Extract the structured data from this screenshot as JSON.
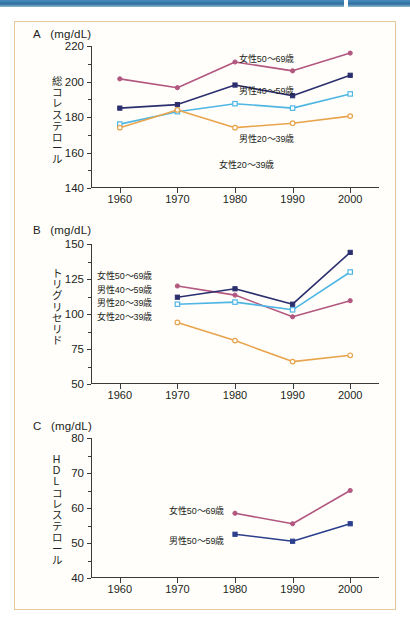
{
  "figure": {
    "frame_color": "#e8c79a",
    "top_bar_color": "#3b7da9"
  },
  "series_colors": {
    "female_50_69": "#b2577f",
    "male_40_59": "#2b2f6e",
    "male_20_39": "#4fb6e3",
    "female_20_39": "#e8a44c",
    "male_50_59": "#2b3f8c"
  },
  "series_labels": {
    "female_50_69": "女性50〜69歳",
    "male_40_59": "男性40〜59歳",
    "male_20_39": "男性20〜39歳",
    "female_20_39": "女性20〜39歳",
    "male_50_59": "男性50〜59歳"
  },
  "panels": {
    "A": {
      "letter": "A",
      "unit": "(mg/dL)",
      "caption_chars": [
        "総",
        "コ",
        "レ",
        "ス",
        "テ",
        "ロ",
        "ー",
        "ル"
      ],
      "caption_text": "総コレステロール",
      "y_ticks": [
        "140",
        "160",
        "180",
        "200",
        "220"
      ],
      "x_ticks": [
        "1960",
        "1970",
        "1980",
        "1990",
        "2000"
      ],
      "annotations": [
        {
          "text": "女性50〜69歳",
          "x": 148,
          "y": 6
        },
        {
          "text": "男性40〜59歳",
          "x": 148,
          "y": 38
        },
        {
          "text": "男性20〜39歳",
          "x": 148,
          "y": 86
        },
        {
          "text": "女性20〜39歳",
          "x": 128,
          "y": 112
        }
      ]
    },
    "B": {
      "letter": "B",
      "unit": "(mg/dL)",
      "caption_chars": [
        "ト",
        "リ",
        "グ",
        "リ",
        "セ",
        "リ",
        "ド"
      ],
      "caption_text": "トリグリセリド",
      "y_ticks": [
        "50",
        "75",
        "100",
        "125",
        "150"
      ],
      "x_ticks": [
        "1960",
        "1970",
        "1980",
        "1990",
        "2000"
      ],
      "legend": [
        "女性50〜69歳",
        "男性40〜59歳",
        "男性20〜39歳",
        "女性20〜39歳"
      ]
    },
    "C": {
      "letter": "C",
      "unit": "(mg/dL)",
      "caption_chars": [
        "H",
        "D",
        "L",
        "コ",
        "レ",
        "ス",
        "テ",
        "ロ",
        "ー",
        "ル"
      ],
      "caption_text": "HDLコレステロール",
      "y_ticks": [
        "40",
        "50",
        "60",
        "70",
        "80"
      ],
      "x_ticks": [
        "1960",
        "1970",
        "1980",
        "1990",
        "2000"
      ],
      "annotations": [
        {
          "text": "女性50〜69歳",
          "x": 78,
          "y": 66
        },
        {
          "text": "男性50〜59歳",
          "x": 78,
          "y": 96
        }
      ]
    }
  },
  "chart_data": [
    {
      "type": "line",
      "panel": "A",
      "title": "総コレステロール",
      "xlabel": "",
      "ylabel": "総コレステロール (mg/dL)",
      "unit": "mg/dL",
      "x": [
        1960,
        1970,
        1980,
        1990,
        2000
      ],
      "ylim": [
        140,
        220
      ],
      "yticks": [
        140,
        160,
        180,
        200,
        220
      ],
      "grid": false,
      "legend": "inline-annotations",
      "series": [
        {
          "name": "女性50〜69歳",
          "color": "#b2577f",
          "marker": "filled-circle",
          "x": [
            1960,
            1970,
            1980,
            1990,
            2000
          ],
          "values": [
            201.5,
            196.5,
            211,
            206,
            216
          ]
        },
        {
          "name": "男性40〜59歳",
          "color": "#2b2f6e",
          "marker": "filled-square",
          "x": [
            1960,
            1970,
            1980,
            1990,
            2000
          ],
          "values": [
            185,
            187,
            198,
            192,
            203.5
          ]
        },
        {
          "name": "男性20〜39歳",
          "color": "#4fb6e3",
          "marker": "open-square",
          "x": [
            1960,
            1970,
            1980,
            1990,
            2000
          ],
          "values": [
            176,
            183,
            187.5,
            185,
            193
          ]
        },
        {
          "name": "女性20〜39歳",
          "color": "#e8a44c",
          "marker": "open-circle",
          "x": [
            1960,
            1970,
            1980,
            1990,
            2000
          ],
          "values": [
            174,
            184,
            174,
            176.5,
            180.5
          ]
        }
      ]
    },
    {
      "type": "line",
      "panel": "B",
      "title": "トリグリセリド",
      "xlabel": "",
      "ylabel": "トリグリセリド (mg/dL)",
      "unit": "mg/dL",
      "x": [
        1970,
        1980,
        1990,
        2000
      ],
      "ylim": [
        50,
        150
      ],
      "yticks": [
        50,
        75,
        100,
        125,
        150
      ],
      "grid": false,
      "legend": "left-stack",
      "series": [
        {
          "name": "女性50〜69歳",
          "color": "#b2577f",
          "marker": "filled-circle",
          "x": [
            1970,
            1980,
            1990,
            2000
          ],
          "values": [
            120,
            113.5,
            98,
            109.5
          ]
        },
        {
          "name": "男性40〜59歳",
          "color": "#2b2f6e",
          "marker": "filled-square",
          "x": [
            1970,
            1980,
            1990,
            2000
          ],
          "values": [
            112,
            118,
            107,
            144
          ]
        },
        {
          "name": "男性20〜39歳",
          "color": "#4fb6e3",
          "marker": "open-square",
          "x": [
            1970,
            1980,
            1990,
            2000
          ],
          "values": [
            107,
            108.5,
            103,
            130
          ]
        },
        {
          "name": "女性20〜39歳",
          "color": "#e8a44c",
          "marker": "open-circle",
          "x": [
            1970,
            1980,
            1990,
            2000
          ],
          "values": [
            94,
            81,
            66,
            70.5
          ]
        }
      ]
    },
    {
      "type": "line",
      "panel": "C",
      "title": "HDLコレステロール",
      "xlabel": "",
      "ylabel": "HDLコレステロール (mg/dL)",
      "unit": "mg/dL",
      "x": [
        1980,
        1990,
        2000
      ],
      "ylim": [
        40,
        80
      ],
      "yticks": [
        40,
        50,
        60,
        70,
        80
      ],
      "grid": false,
      "legend": "inline-annotations",
      "series": [
        {
          "name": "女性50〜69歳",
          "color": "#b2577f",
          "marker": "filled-circle",
          "x": [
            1980,
            1990,
            2000
          ],
          "values": [
            58.5,
            55.5,
            65
          ]
        },
        {
          "name": "男性50〜59歳",
          "color": "#2b3f8c",
          "marker": "filled-square",
          "x": [
            1980,
            1990,
            2000
          ],
          "values": [
            52.5,
            50.5,
            55.5
          ]
        }
      ]
    }
  ]
}
